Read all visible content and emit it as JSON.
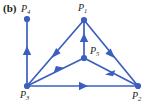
{
  "figure": {
    "panel_label": "(b)",
    "accent_color": "#3a5fbd",
    "text_color": "#231f20",
    "background": "#ffffff",
    "width": 150,
    "height": 106
  },
  "graph": {
    "type": "directed-graph",
    "nodes": [
      {
        "id": "P1",
        "label": "P",
        "sub": "1",
        "x": 84,
        "y": 20,
        "label_pos": "above"
      },
      {
        "id": "P2",
        "label": "P",
        "sub": "2",
        "x": 138,
        "y": 86,
        "label_pos": "below-right"
      },
      {
        "id": "P3",
        "label": "P",
        "sub": "3",
        "x": 27,
        "y": 86,
        "label_pos": "below"
      },
      {
        "id": "P4",
        "label": "P",
        "sub": "4",
        "x": 27,
        "y": 19,
        "label_pos": "above"
      },
      {
        "id": "P5",
        "label": "P",
        "sub": "5",
        "x": 84,
        "y": 58,
        "label_pos": "right"
      }
    ],
    "edges": [
      {
        "from": "P3",
        "to": "P4",
        "arrow_at": 0.5
      },
      {
        "from": "P1",
        "to": "P3",
        "arrow_at": 0.5
      },
      {
        "from": "P3",
        "to": "P5",
        "arrow_at": 0.55
      },
      {
        "from": "P5",
        "to": "P1",
        "arrow_at": 0.5
      },
      {
        "from": "P1",
        "to": "P2",
        "arrow_at": 0.5
      },
      {
        "from": "P2",
        "to": "P5",
        "arrow_at": 0.5
      },
      {
        "from": "P3",
        "to": "P2",
        "arrow_at": 0.5
      }
    ]
  },
  "labels": {
    "P1": "P",
    "P1_sub": "1",
    "P2": "P",
    "P2_sub": "2",
    "P3": "P",
    "P3_sub": "3",
    "P4": "P",
    "P4_sub": "4",
    "P5": "P",
    "P5_sub": "5"
  }
}
